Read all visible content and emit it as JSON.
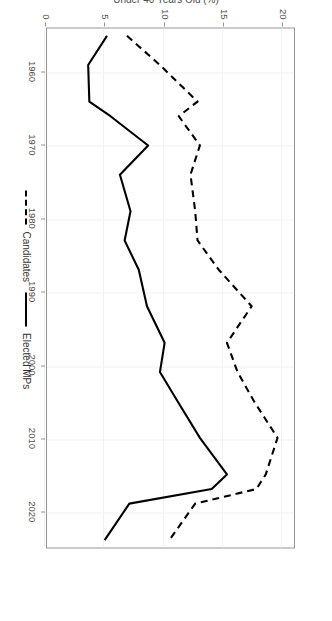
{
  "chart_data": {
    "type": "line",
    "title": "",
    "subtitle": "",
    "xlabel": "",
    "ylabel": "Under 40 Years Old (%)",
    "xlim": [
      1954,
      2025
    ],
    "ylim": [
      0,
      21
    ],
    "xticks": [
      1960,
      1970,
      1980,
      1990,
      2000,
      2010,
      2020
    ],
    "yticks": [
      0,
      5,
      10,
      15,
      20
    ],
    "grid": true,
    "legend_position": "bottom",
    "orientation": "rotated-90",
    "x": [
      1955,
      1959,
      1964,
      1966,
      1970,
      1974,
      1979,
      1983,
      1987,
      1992,
      1997,
      2001,
      2005,
      2010,
      2015,
      2017,
      2019,
      2024
    ],
    "series": [
      {
        "name": "Candidates",
        "style": "dashed",
        "color": "#000000",
        "values": [
          6.8,
          9.6,
          12.8,
          11.2,
          13.0,
          12.2,
          12.6,
          12.8,
          14.6,
          17.4,
          15.3,
          16.2,
          17.6,
          19.6,
          18.6,
          17.8,
          12.6,
          10.4
        ]
      },
      {
        "name": "Elected MPs",
        "style": "solid",
        "color": "#000000",
        "values": [
          5.1,
          3.5,
          3.6,
          5.4,
          8.6,
          6.2,
          7.1,
          6.6,
          7.8,
          8.5,
          10.0,
          9.6,
          11.1,
          13.0,
          15.3,
          14.0,
          7.0,
          4.9
        ]
      }
    ]
  },
  "legend": {
    "items": [
      {
        "label": "Candidates",
        "style": "dashed"
      },
      {
        "label": "Elected MPs",
        "style": "solid"
      }
    ]
  },
  "axis_labels": {
    "x": [
      "1960",
      "1970",
      "1980",
      "1990",
      "2000",
      "2010",
      "2020"
    ],
    "y": [
      "0",
      "5",
      "10",
      "15",
      "20"
    ],
    "y_title": "Under 40 Years Old (%)"
  },
  "colors": {
    "line": "#000000",
    "panel_border": "#959595",
    "grid": "#f2f2f2",
    "text": "#4d4d4d",
    "background": "#ffffff"
  }
}
